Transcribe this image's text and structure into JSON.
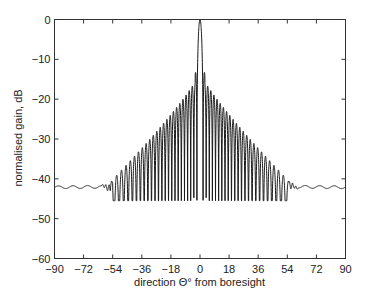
{
  "chart_data": {
    "type": "line",
    "title": "",
    "xlabel": "direction Θ° from boresight",
    "ylabel": "normalised gain, dB",
    "xlim": [
      -90,
      90
    ],
    "ylim": [
      -60,
      0
    ],
    "xticks": [
      -90,
      -72,
      -54,
      -36,
      -18,
      0,
      18,
      36,
      54,
      72,
      90
    ],
    "yticks": [
      0,
      -10,
      -20,
      -30,
      -40,
      -50,
      -60
    ],
    "xtick_labels": [
      "−90",
      "−72",
      "−54",
      "−36",
      "−18",
      "0",
      "18",
      "36",
      "54",
      "72",
      "90"
    ],
    "ytick_labels": [
      "0",
      "−10",
      "−20",
      "−30",
      "−40",
      "−50",
      "−60"
    ],
    "grid": false,
    "legend": null,
    "series": [
      {
        "name": "array gain pattern",
        "description": "Main lobe 0 dB at 0°, first sidelobes ≈ −13 dB, dense oscillating sidelobes decaying to ≈ −42 dB floor beyond ±60°",
        "x": [
          -90,
          -72,
          -60,
          -54,
          -45,
          -36,
          -27,
          -18,
          -9,
          -3,
          -2,
          0,
          2,
          3,
          9,
          18,
          27,
          36,
          45,
          54,
          60,
          72,
          90
        ],
        "y": [
          -42.3,
          -42.0,
          -41.5,
          -40.5,
          -36.5,
          -32.5,
          -28.5,
          -25,
          -19,
          -13.3,
          -25,
          0,
          -25,
          -13.3,
          -19,
          -25,
          -28.5,
          -32.5,
          -36.5,
          -40.5,
          -41.5,
          -42.0,
          -42.3
        ]
      }
    ],
    "colors": {
      "line": "#1a1a1a",
      "axis": "#333333"
    }
  }
}
